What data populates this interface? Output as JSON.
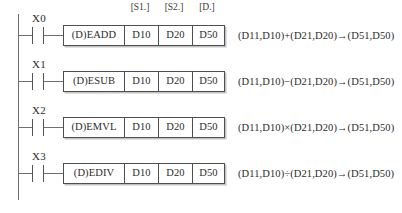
{
  "diagram": {
    "type": "ladder-logic",
    "headers": {
      "s1": "[S1.]",
      "s2": "[S2.]",
      "d": "[D.]"
    },
    "rungs": [
      {
        "contact": "X0",
        "contact_type": "normally-open",
        "instruction": "(D)EADD",
        "s1": "D10",
        "s2": "D20",
        "d": "D50",
        "expression": "(D11,D10)+(D21,D20)→(D51,D50)"
      },
      {
        "contact": "X1",
        "contact_type": "normally-open",
        "instruction": "(D)ESUB",
        "s1": "D10",
        "s2": "D20",
        "d": "D50",
        "expression": "(D11,D10)−(D21,D20)→(D51,D50)"
      },
      {
        "contact": "X2",
        "contact_type": "normally-open",
        "instruction": "(D)EMVL",
        "s1": "D10",
        "s2": "D20",
        "d": "D50",
        "expression": "(D11,D10)×(D21,D20)→(D51,D50)"
      },
      {
        "contact": "X3",
        "contact_type": "normally-open",
        "instruction": "(D)EDIV",
        "s1": "D10",
        "s2": "D20",
        "d": "D50",
        "expression": "(D11,D10)÷(D21,D20)→(D51,D50)"
      }
    ],
    "colors": {
      "line": "#4f4f4f",
      "rail": "#6f6f6f",
      "text": "#2b2b2b",
      "background": "#ffffff"
    }
  }
}
